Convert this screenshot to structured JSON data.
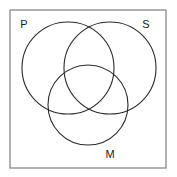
{
  "diagram": {
    "type": "venn-3-set",
    "background_color": "#ffffff",
    "frame": {
      "name": "universal-set-frame",
      "x": 10,
      "y": 10,
      "width": 156,
      "height": 158,
      "stroke_color": "#888888",
      "stroke_width": 1.3
    },
    "circle_stroke_color": "#2b2b2b",
    "circle_stroke_width": 1.1,
    "sets": [
      {
        "id": "P",
        "label": "P",
        "cx": 68,
        "cy": 68,
        "r": 46,
        "label_x": 24,
        "label_y": 25
      },
      {
        "id": "S",
        "label": "S",
        "cx": 110,
        "cy": 68,
        "r": 46,
        "label_x": 146,
        "label_y": 25
      },
      {
        "id": "M",
        "label": "M",
        "cx": 88,
        "cy": 105,
        "r": 40,
        "label_x": 110,
        "label_y": 155
      }
    ]
  }
}
